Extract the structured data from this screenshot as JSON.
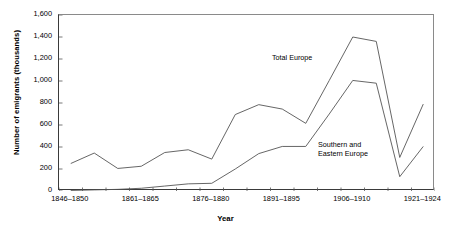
{
  "chart_data": {
    "type": "line",
    "title": "",
    "xlabel": "Year",
    "ylabel": "Number of emigrants (thousands)",
    "ylim": [
      0,
      1600
    ],
    "yticks": [
      0,
      200,
      400,
      600,
      800,
      1000,
      1200,
      1400,
      1600
    ],
    "ytick_labels": [
      "0",
      "200",
      "400",
      "600",
      "800",
      "1,000",
      "1,200",
      "1,400",
      "1,600"
    ],
    "grid": false,
    "legend": "inline-annotation",
    "categories": [
      "1846-1850",
      "1851-1855",
      "1856-1860",
      "1861-1865",
      "1866-1870",
      "1871-1875",
      "1876-1880",
      "1881-1885",
      "1886-1890",
      "1891-1895",
      "1896-1900",
      "1901-1905",
      "1906-1910",
      "1911-1915",
      "1916-1920",
      "1921-1924"
    ],
    "xtick_labels": [
      {
        "index": 0,
        "label": "1846–1850"
      },
      {
        "index": 3,
        "label": "1861–1865"
      },
      {
        "index": 6,
        "label": "1876–1880"
      },
      {
        "index": 9,
        "label": "1891–1895"
      },
      {
        "index": 12,
        "label": "1906–1910"
      },
      {
        "index": 15,
        "label": "1921–1924"
      }
    ],
    "series": [
      {
        "name": "Total Europe",
        "label_line1": "Total Europe",
        "label_line2": "",
        "color": "#555555",
        "values": [
          250,
          345,
          205,
          225,
          350,
          375,
          290,
          695,
          785,
          745,
          615,
          1005,
          1400,
          1360,
          305,
          790
        ]
      },
      {
        "name": "Southern and Eastern Europe",
        "label_line1": "Southern and",
        "label_line2": "Eastern Europe",
        "color": "#555555",
        "values": [
          5,
          10,
          15,
          25,
          45,
          65,
          70,
          200,
          340,
          405,
          405,
          700,
          1005,
          980,
          130,
          405
        ]
      }
    ]
  },
  "annotations": {
    "total_europe": "Total Europe",
    "southern_eastern_line1": "Southern and",
    "southern_eastern_line2": "Eastern Europe"
  }
}
